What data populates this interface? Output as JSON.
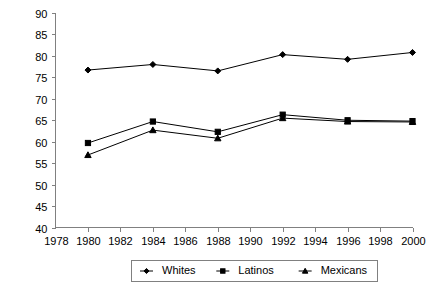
{
  "chart_data": {
    "type": "line",
    "title": "",
    "subtitle": "",
    "xlabel": "",
    "ylabel": "",
    "x": [
      1980,
      1984,
      1988,
      1992,
      1996,
      2000
    ],
    "xlim": [
      1978,
      2000
    ],
    "ylim": [
      40,
      90
    ],
    "xticks": [
      1978,
      1980,
      1982,
      1984,
      1986,
      1988,
      1990,
      1992,
      1994,
      1996,
      1998,
      2000
    ],
    "yticks": [
      40,
      45,
      50,
      55,
      60,
      65,
      70,
      75,
      80,
      85,
      90
    ],
    "grid": false,
    "legend_position": "bottom",
    "series": [
      {
        "name": "Whites",
        "marker": "diamond",
        "color": "#000000",
        "values": [
          76.7,
          78.0,
          76.5,
          80.3,
          79.2,
          80.8
        ]
      },
      {
        "name": "Latinos",
        "marker": "square",
        "color": "#000000",
        "values": [
          59.7,
          64.7,
          62.3,
          66.3,
          65.0,
          64.8
        ]
      },
      {
        "name": "Mexicans",
        "marker": "triangle",
        "color": "#000000",
        "values": [
          56.9,
          62.7,
          60.8,
          65.5,
          64.7,
          64.6
        ]
      }
    ]
  },
  "axes": {
    "y_tick_labels": [
      "90",
      "85",
      "80",
      "75",
      "70",
      "65",
      "60",
      "55",
      "50",
      "45",
      "40"
    ],
    "x_tick_labels": [
      "1978",
      "1980",
      "1982",
      "1984",
      "1986",
      "1988",
      "1990",
      "1992",
      "1994",
      "1996",
      "1998",
      "2000"
    ]
  },
  "legend": {
    "entries": [
      {
        "label": "Whites",
        "marker": "diamond"
      },
      {
        "label": "Latinos",
        "marker": "square"
      },
      {
        "label": "Mexicans",
        "marker": "triangle"
      }
    ]
  },
  "colors": {
    "series_line": "#000000",
    "axis": "#808080",
    "background": "#ffffff",
    "text": "#000000"
  }
}
